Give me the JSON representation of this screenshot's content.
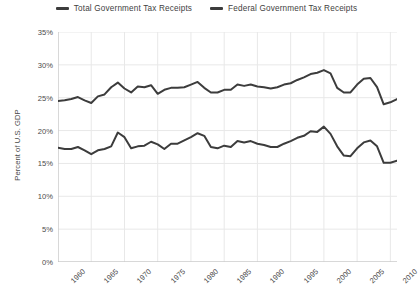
{
  "legend": {
    "position": "top-center",
    "items": [
      {
        "label": "Total Government Tax Receipts",
        "color": "#3c3c3c",
        "icon": "line-swatch-icon"
      },
      {
        "label": "Federal Government Tax Receipts",
        "color": "#3c3c3c",
        "icon": "line-swatch-icon"
      }
    ]
  },
  "axes": {
    "y_title": "Percent of U.S. GDP",
    "y_ticks": [
      "0%",
      "5%",
      "10%",
      "15%",
      "20%",
      "25%",
      "30%",
      "35%"
    ],
    "x_ticks": [
      "1960",
      "1965",
      "1970",
      "1975",
      "1980",
      "1985",
      "1990",
      "1995",
      "2000",
      "2005",
      "2010"
    ]
  },
  "chart_data": {
    "type": "line",
    "title": "",
    "subtitle": "",
    "xlabel": "",
    "ylabel": "Percent of U.S. GDP",
    "xlim": [
      1960,
      2011
    ],
    "ylim": [
      0,
      35
    ],
    "y_tick_values": [
      0,
      5,
      10,
      15,
      20,
      25,
      30,
      35
    ],
    "x_tick_values": [
      1960,
      1965,
      1970,
      1975,
      1980,
      1985,
      1990,
      1995,
      2000,
      2005,
      2010
    ],
    "grid": "horizontal-and-vertical-light",
    "legend_position": "top-center",
    "x": [
      1960,
      1961,
      1962,
      1963,
      1964,
      1965,
      1966,
      1967,
      1968,
      1969,
      1970,
      1971,
      1972,
      1973,
      1974,
      1975,
      1976,
      1977,
      1978,
      1979,
      1980,
      1981,
      1982,
      1983,
      1984,
      1985,
      1986,
      1987,
      1988,
      1989,
      1990,
      1991,
      1992,
      1993,
      1994,
      1995,
      1996,
      1997,
      1998,
      1999,
      2000,
      2001,
      2002,
      2003,
      2004,
      2005,
      2006,
      2007,
      2008,
      2009,
      2010,
      2011
    ],
    "series": [
      {
        "name": "Total Government Tax Receipts",
        "color": "#3c3c3c",
        "values": [
          24.5,
          24.6,
          24.8,
          25.1,
          24.6,
          24.2,
          25.2,
          25.5,
          26.6,
          27.3,
          26.4,
          25.8,
          26.7,
          26.6,
          26.9,
          25.6,
          26.2,
          26.5,
          26.5,
          26.6,
          27.0,
          27.4,
          26.5,
          25.8,
          25.8,
          26.2,
          26.2,
          27.0,
          26.8,
          27.0,
          26.7,
          26.6,
          26.4,
          26.6,
          27.0,
          27.2,
          27.7,
          28.1,
          28.6,
          28.8,
          29.2,
          28.7,
          26.5,
          25.8,
          25.8,
          27.0,
          27.9,
          28.0,
          26.6,
          24.0,
          24.3,
          24.8
        ],
        "style": "solid",
        "width": 2
      },
      {
        "name": "Federal Government Tax Receipts",
        "color": "#3c3c3c",
        "values": [
          17.4,
          17.2,
          17.2,
          17.5,
          17.0,
          16.4,
          17.0,
          17.2,
          17.6,
          19.7,
          19.0,
          17.3,
          17.6,
          17.7,
          18.3,
          17.9,
          17.2,
          18.0,
          18.0,
          18.5,
          19.0,
          19.6,
          19.2,
          17.5,
          17.3,
          17.7,
          17.5,
          18.4,
          18.2,
          18.4,
          18.0,
          17.8,
          17.5,
          17.5,
          18.0,
          18.4,
          18.9,
          19.2,
          19.9,
          19.8,
          20.6,
          19.5,
          17.6,
          16.2,
          16.1,
          17.3,
          18.2,
          18.5,
          17.6,
          15.1,
          15.1,
          15.4
        ],
        "style": "solid",
        "width": 2
      }
    ]
  },
  "style": {
    "background": "#ffffff",
    "grid_color": "#e8e8e8",
    "axis_color": "#bdbdbd",
    "text_color": "#4a4a4a",
    "line_color": "#3c3c3c"
  }
}
